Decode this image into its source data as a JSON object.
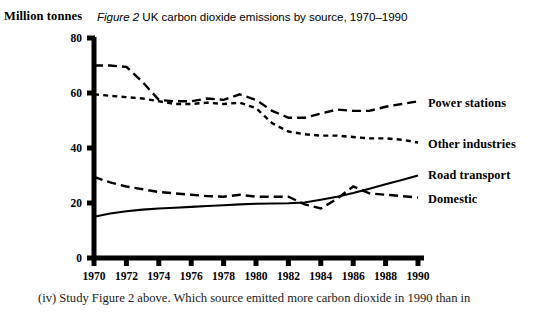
{
  "axis_unit_label": "Million tonnes",
  "title": {
    "figure_label": "Figure 2",
    "rest": "UK carbon dioxide emissions by source, 1970–1990"
  },
  "caption": "(iv) Study Figure 2 above. Which source emitted more carbon dioxide in 1990 than in",
  "colors": {
    "ink": "#000000",
    "background": "#ffffff"
  },
  "chart_data": {
    "type": "line",
    "title": "Figure 2 UK carbon dioxide emissions by source, 1970–1990",
    "xlabel": "",
    "ylabel": "Million tonnes",
    "xlim": [
      1970,
      1990
    ],
    "ylim": [
      0,
      80
    ],
    "xticks": [
      1970,
      1972,
      1974,
      1976,
      1978,
      1980,
      1982,
      1984,
      1986,
      1988,
      1990
    ],
    "xtick_labels": [
      "1970",
      "1972",
      "1974",
      "1976",
      "1978",
      "1980",
      "1982",
      "1984",
      "1986",
      "1988",
      "1990"
    ],
    "yticks": [
      0,
      20,
      40,
      60,
      80
    ],
    "ytick_labels": [
      "0",
      "20",
      "40",
      "60",
      "80"
    ],
    "grid": false,
    "legend_position": "right-inline-labels",
    "x": [
      1970,
      1971,
      1972,
      1973,
      1974,
      1975,
      1976,
      1977,
      1978,
      1979,
      1980,
      1981,
      1982,
      1983,
      1984,
      1985,
      1986,
      1987,
      1988,
      1989,
      1990
    ],
    "series": [
      {
        "name": "Power stations",
        "style": "long-dash",
        "label_y_value": 56.5,
        "values": [
          70,
          70,
          69.5,
          64,
          57.5,
          57,
          57,
          58,
          57.5,
          59.5,
          57.5,
          53.5,
          51,
          51,
          52.5,
          54,
          53.5,
          53.5,
          55,
          56,
          57
        ]
      },
      {
        "name": "Other industries",
        "style": "short-dash",
        "label_y_value": 41.5,
        "values": [
          59.5,
          59,
          58.5,
          58,
          57,
          56,
          56,
          56.5,
          56,
          56.5,
          54.5,
          49,
          46,
          45,
          44.5,
          44.5,
          44,
          43.5,
          43.5,
          43,
          42
        ]
      },
      {
        "name": "Road transport",
        "style": "solid",
        "label_y_value": 30.5,
        "values": [
          15,
          16.2,
          17,
          17.6,
          18,
          18.3,
          18.6,
          18.9,
          19.2,
          19.5,
          19.7,
          19.8,
          19.9,
          20.2,
          21.2,
          22.3,
          23.6,
          25.2,
          26.8,
          28.4,
          30
        ]
      },
      {
        "name": "Domestic",
        "style": "long-dash",
        "label_y_value": 21.5,
        "values": [
          29.5,
          27.5,
          26,
          25,
          24,
          23.5,
          23,
          22.5,
          22.3,
          23,
          22.3,
          22.3,
          22.3,
          19.5,
          18,
          21.5,
          26,
          23.5,
          23,
          22.5,
          22
        ]
      }
    ]
  }
}
